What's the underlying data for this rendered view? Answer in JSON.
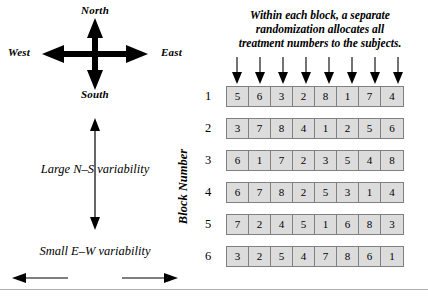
{
  "caption": {
    "line1": "Within each block, a separate",
    "line2": "randomization allocates all",
    "line3": "treatment numbers to the subjects."
  },
  "compass": {
    "name": "compass-rose",
    "north": "North",
    "south": "South",
    "east": "East",
    "west": "West"
  },
  "variability": {
    "ns_label": "Large N–S variability",
    "ew_label": "Small E–W variability"
  },
  "grid": {
    "axis_title": "Block Number",
    "arrow_count": 8,
    "rows": [
      {
        "label": "1",
        "values": [
          "5",
          "6",
          "3",
          "2",
          "8",
          "1",
          "7",
          "4"
        ]
      },
      {
        "label": "2",
        "values": [
          "3",
          "7",
          "8",
          "4",
          "1",
          "2",
          "5",
          "6"
        ]
      },
      {
        "label": "3",
        "values": [
          "6",
          "1",
          "7",
          "2",
          "3",
          "5",
          "4",
          "8"
        ]
      },
      {
        "label": "4",
        "values": [
          "6",
          "7",
          "8",
          "2",
          "5",
          "3",
          "1",
          "4"
        ]
      },
      {
        "label": "5",
        "values": [
          "7",
          "2",
          "4",
          "5",
          "1",
          "6",
          "8",
          "3"
        ]
      },
      {
        "label": "6",
        "values": [
          "3",
          "2",
          "5",
          "4",
          "7",
          "8",
          "6",
          "1"
        ]
      }
    ]
  },
  "colors": {
    "cell_fill": "#dcdcdc",
    "cell_border": "#808080",
    "ink": "#000000",
    "rule": "#b0b0b0",
    "background": "#ffffff"
  }
}
